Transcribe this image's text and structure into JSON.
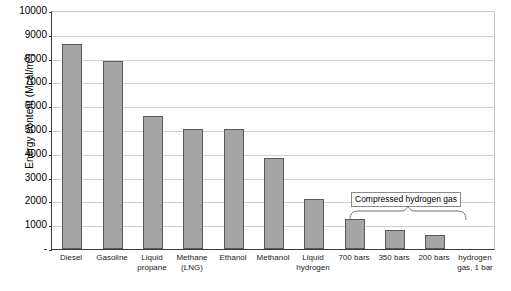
{
  "chart_data": {
    "type": "bar",
    "title": "",
    "xlabel": "",
    "ylabel": "Energy content (Mcal/m3)",
    "ylabel_html": "Energy content (Mcal/m<sup>3</sup>)",
    "ylim": [
      0,
      10000
    ],
    "ytick_step": 1000,
    "yticks": [
      10000,
      9000,
      8000,
      7000,
      6000,
      5000,
      4000,
      3000,
      2000,
      1000,
      "-"
    ],
    "grid": true,
    "legend": "none",
    "categories": [
      "Diesel",
      "Gasoline",
      "Liquid propane",
      "Methane (LNG)",
      "Ethanol",
      "Methanol",
      "Liquid hydrogen",
      "700 bars",
      "350 bars",
      "200 bars",
      "hydrogen gas, 1 bar"
    ],
    "category_lines": [
      [
        "Diesel"
      ],
      [
        "Gasoline"
      ],
      [
        "Liquid",
        "propane"
      ],
      [
        "Methane",
        "(LNG)"
      ],
      [
        "Ethanol"
      ],
      [
        "Methanol"
      ],
      [
        "Liquid",
        "hydrogen"
      ],
      [
        "700 bars"
      ],
      [
        "350 bars"
      ],
      [
        "200 bars"
      ],
      [
        "hydrogen",
        "gas, 1 bar"
      ]
    ],
    "values": [
      8600,
      7900,
      5600,
      5050,
      5050,
      3830,
      2100,
      1250,
      780,
      580,
      3
    ],
    "bar_color": "#a5a5a5",
    "bar_border_color": "#5a5a5a",
    "annotations": [
      {
        "text": "Compressed hydrogen gas",
        "spans": [
          "700 bars",
          "350 bars",
          "200 bars"
        ],
        "style": "boxed-label-with-brace"
      }
    ]
  }
}
